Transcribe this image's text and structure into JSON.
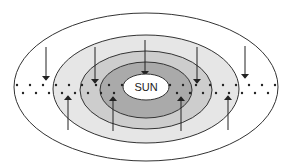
{
  "diagram": {
    "sun_label": "SUN",
    "colors": {
      "outline": "#333333",
      "zone_outer": "#ffffff",
      "zone_light": "#e6e6e6",
      "zone_medium": "#cdcdcd",
      "zone_dark": "#aaaaaa",
      "sun_fill": "#ffffff"
    },
    "zones": [
      {
        "name": "outer-zone",
        "cx": 146,
        "cy": 87,
        "rx": 132,
        "ry": 74,
        "fill": "#ffffff"
      },
      {
        "name": "light-zone",
        "cx": 146,
        "cy": 89,
        "rx": 93,
        "ry": 54,
        "fill": "#e6e6e6"
      },
      {
        "name": "medium-zone",
        "cx": 146,
        "cy": 90,
        "rx": 66,
        "ry": 39,
        "fill": "#cdcdcd"
      },
      {
        "name": "dark-zone",
        "cx": 146,
        "cy": 90,
        "rx": 46,
        "ry": 28,
        "fill": "#aaaaaa"
      },
      {
        "name": "sun",
        "cx": 146,
        "cy": 87,
        "rx": 23,
        "ry": 13,
        "fill": "#ffffff"
      }
    ],
    "down_arrows": [
      {
        "x": 46,
        "y1": 47,
        "y2": 80
      },
      {
        "x": 95,
        "y1": 47,
        "y2": 83
      },
      {
        "x": 145,
        "y1": 40,
        "y2": 75
      },
      {
        "x": 197,
        "y1": 47,
        "y2": 83
      },
      {
        "x": 245,
        "y1": 46,
        "y2": 78
      }
    ],
    "up_arrows": [
      {
        "x": 68,
        "y1": 130,
        "y2": 96
      },
      {
        "x": 113,
        "y1": 131,
        "y2": 97
      },
      {
        "x": 181,
        "y1": 131,
        "y2": 97
      },
      {
        "x": 228,
        "y1": 130,
        "y2": 96
      }
    ],
    "dots_upper": [
      17,
      30,
      43,
      56,
      69,
      82,
      96,
      109,
      122,
      170,
      183,
      196,
      210,
      223,
      236,
      249,
      262,
      275
    ],
    "dots_lower": [
      23,
      36,
      49,
      62,
      75,
      88,
      101,
      114,
      177,
      190,
      203,
      216,
      229,
      242,
      255,
      268
    ],
    "dots_upper_y": 85,
    "dots_lower_y": 93
  }
}
